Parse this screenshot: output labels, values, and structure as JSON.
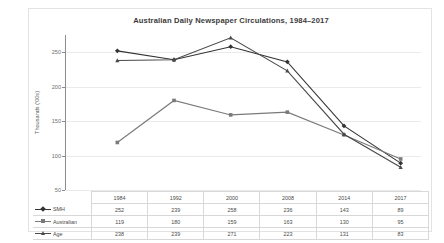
{
  "chart_data": {
    "type": "line",
    "title": "Australian Daily Newspaper Circulations, 1984–2017",
    "xlabel": "",
    "ylabel": "Thousands ('00s)",
    "categories": [
      "1984",
      "1992",
      "2000",
      "2008",
      "2014",
      "2017"
    ],
    "ylim": [
      50,
      275
    ],
    "yticks": [
      50,
      100,
      150,
      200,
      250
    ],
    "grid": true,
    "legend_position": "table-row-labels",
    "series": [
      {
        "name": "SMH",
        "marker": "diamond",
        "color": "#333333",
        "values": [
          252,
          239,
          258,
          236,
          143,
          89
        ]
      },
      {
        "name": "Australian",
        "marker": "square",
        "color": "#7a7a7a",
        "values": [
          119,
          180,
          159,
          163,
          130,
          95
        ]
      },
      {
        "name": "Age",
        "marker": "triangle",
        "color": "#4a4a4a",
        "values": [
          238,
          239,
          271,
          223,
          131,
          83
        ]
      }
    ]
  },
  "table": {
    "header_corner": "",
    "columns": [
      "1984",
      "1992",
      "2000",
      "2008",
      "2014",
      "2017"
    ],
    "rows": [
      {
        "label": "SMH",
        "values": [
          "252",
          "239",
          "258",
          "236",
          "143",
          "89"
        ]
      },
      {
        "label": "Australian",
        "values": [
          "119",
          "180",
          "159",
          "163",
          "130",
          "95"
        ]
      },
      {
        "label": "Age",
        "values": [
          "238",
          "239",
          "271",
          "223",
          "131",
          "83"
        ]
      }
    ]
  },
  "axis": {
    "y_tick_labels": [
      "250",
      "200",
      "150",
      "100",
      "50"
    ],
    "y_title": "Thousands ('00s)"
  },
  "colors": {
    "smh": "#333333",
    "australian": "#7a7a7a",
    "age": "#4a4a4a",
    "grid": "#eaeaea",
    "axis": "#8d8d8d",
    "frame": "#e3e3e3",
    "text": "#4a4a4a"
  }
}
